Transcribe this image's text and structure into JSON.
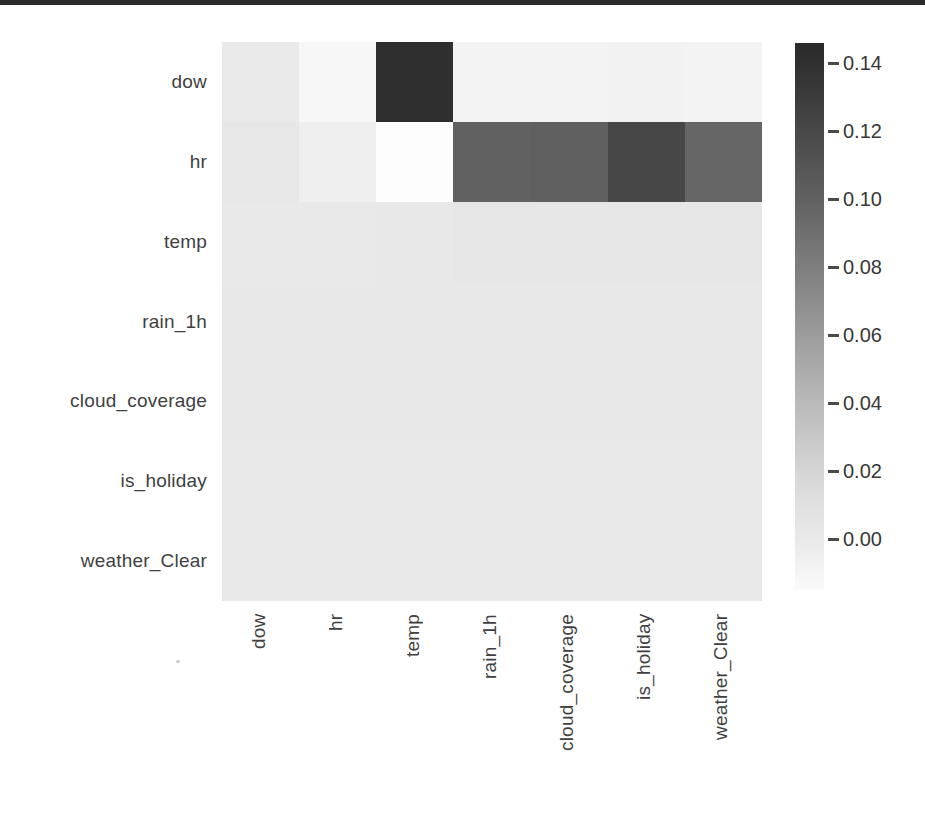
{
  "page": {
    "background": "#ffffff",
    "top_rule_color": "#2b2b2b"
  },
  "chart_data": {
    "type": "heatmap",
    "title": "",
    "xlabel": "",
    "ylabel": "",
    "grid": false,
    "legend_position": "colorbar-right",
    "rows": [
      "dow",
      "hr",
      "temp",
      "rain_1h",
      "cloud_coverage",
      "is_holiday",
      "weather_Clear"
    ],
    "cols": [
      "dow",
      "hr",
      "temp",
      "rain_1h",
      "cloud_coverage",
      "is_holiday",
      "weather_Clear"
    ],
    "values": [
      [
        0.008,
        -0.004,
        0.145,
        -0.002,
        -0.002,
        -0.002,
        -0.002
      ],
      [
        0.012,
        0.006,
        -0.012,
        0.1,
        0.101,
        0.121,
        0.097
      ],
      [
        0.01,
        0.01,
        0.01,
        0.012,
        0.012,
        0.012,
        0.012
      ],
      [
        0.011,
        0.011,
        0.011,
        0.011,
        0.011,
        0.011,
        0.011
      ],
      [
        0.011,
        0.011,
        0.011,
        0.011,
        0.011,
        0.011,
        0.011
      ],
      [
        0.01,
        0.01,
        0.01,
        0.01,
        0.01,
        0.01,
        0.01
      ],
      [
        0.01,
        0.01,
        0.01,
        0.01,
        0.01,
        0.01,
        0.01
      ]
    ],
    "cell_colors": [
      [
        "#eaeaea",
        "#f7f7f7",
        "#2f2f2f",
        "#f3f3f3",
        "#f3f3f3",
        "#f2f2f2",
        "#f3f3f3"
      ],
      [
        "#e7e7e7",
        "#efefef",
        "#fdfdfd",
        "#616161",
        "#5f5f5f",
        "#474747",
        "#666666"
      ],
      [
        "#e9e9e9",
        "#e9e9e9",
        "#e8e8e8",
        "#e6e6e6",
        "#e6e6e6",
        "#e6e6e6",
        "#e6e6e6"
      ],
      [
        "#e8e8e8",
        "#e8e8e8",
        "#e8e8e8",
        "#e8e8e8",
        "#e8e8e8",
        "#e8e8e8",
        "#e8e8e8"
      ],
      [
        "#e8e8e8",
        "#e8e8e8",
        "#e8e8e8",
        "#e8e8e8",
        "#e8e8e8",
        "#e8e8e8",
        "#e8e8e8"
      ],
      [
        "#e9e9e9",
        "#e9e9e9",
        "#e9e9e9",
        "#e9e9e9",
        "#e9e9e9",
        "#e9e9e9",
        "#e9e9e9"
      ],
      [
        "#e9e9e9",
        "#e9e9e9",
        "#e9e9e9",
        "#e9e9e9",
        "#e9e9e9",
        "#e9e9e9",
        "#e9e9e9"
      ]
    ],
    "colorbar": {
      "range": [
        -0.015,
        0.146
      ],
      "ticks": [
        {
          "label": "0.14",
          "value": 0.14
        },
        {
          "label": "0.12",
          "value": 0.12
        },
        {
          "label": "0.10",
          "value": 0.1
        },
        {
          "label": "0.08",
          "value": 0.08
        },
        {
          "label": "0.06",
          "value": 0.06
        },
        {
          "label": "0.04",
          "value": 0.04
        },
        {
          "label": "0.02",
          "value": 0.02
        },
        {
          "label": "0.00",
          "value": 0.0
        }
      ],
      "gradient_stops": [
        {
          "pos": 0,
          "color": "#2b2b2b"
        },
        {
          "pos": 3.5,
          "color": "#2f2f2f"
        },
        {
          "pos": 16,
          "color": "#484848"
        },
        {
          "pos": 28.5,
          "color": "#616161"
        },
        {
          "pos": 41,
          "color": "#7e7e7e"
        },
        {
          "pos": 53.5,
          "color": "#9c9c9c"
        },
        {
          "pos": 66,
          "color": "#bababa"
        },
        {
          "pos": 78.5,
          "color": "#d6d6d6"
        },
        {
          "pos": 91,
          "color": "#eaeaea"
        },
        {
          "pos": 100,
          "color": "#fbfbfb"
        }
      ],
      "tick_color": "#4a4a4a",
      "label_color": "#383838"
    },
    "axis_label_color": "#3f3f3f"
  }
}
